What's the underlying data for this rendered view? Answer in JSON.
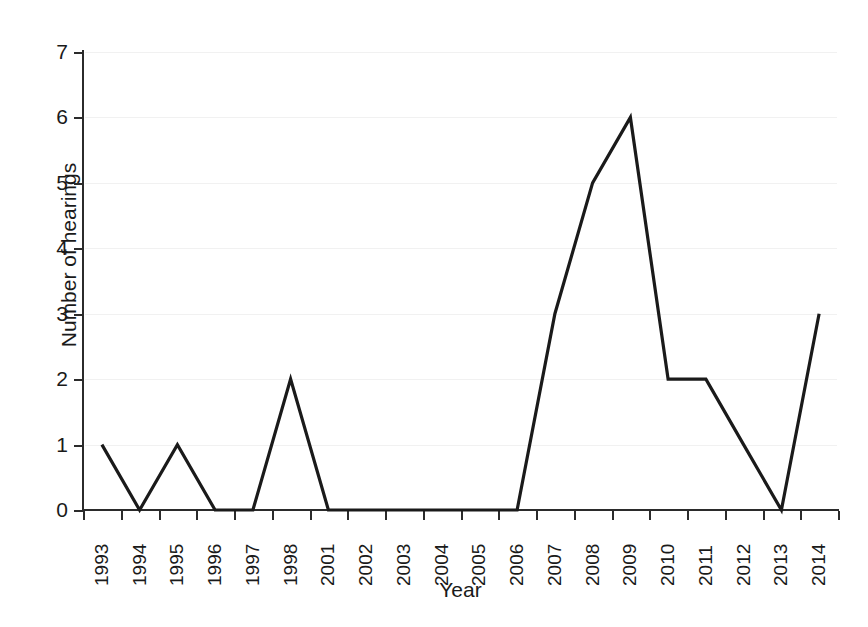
{
  "chart_data": {
    "type": "line",
    "title": "",
    "subtitle": "",
    "xlabel": "Year",
    "ylabel": "Number of hearings",
    "categories": [
      "1993",
      "1994",
      "1995",
      "1996",
      "1997",
      "1998",
      "2001",
      "2002",
      "2003",
      "2004",
      "2005",
      "2006",
      "2007",
      "2008",
      "2009",
      "2010",
      "2011",
      "2012",
      "2013",
      "2014"
    ],
    "values": [
      1,
      0,
      1,
      0,
      0,
      2,
      0,
      0,
      0,
      0,
      0,
      0,
      3,
      5,
      6,
      2,
      2,
      1,
      0,
      3
    ],
    "series": [
      {
        "name": "Number of hearings",
        "values": [
          1,
          0,
          1,
          0,
          0,
          2,
          0,
          0,
          0,
          0,
          0,
          0,
          3,
          5,
          6,
          2,
          2,
          1,
          0,
          3
        ]
      }
    ],
    "ylim": [
      0,
      7
    ],
    "yticks": [
      0,
      1,
      2,
      3,
      4,
      5,
      6,
      7
    ],
    "ytick_labels": [
      "0",
      "1",
      "2",
      "3",
      "4",
      "5",
      "6",
      "7"
    ],
    "grid": "horizontal",
    "legend": "none",
    "line_color": "#1a1a1a",
    "grid_color": "#f1f1f1",
    "axis_color": "#2b2b2b",
    "background_color": "#ffffff",
    "markers": "none",
    "note": "Years 1999 and 2000 are absent from the category axis"
  }
}
